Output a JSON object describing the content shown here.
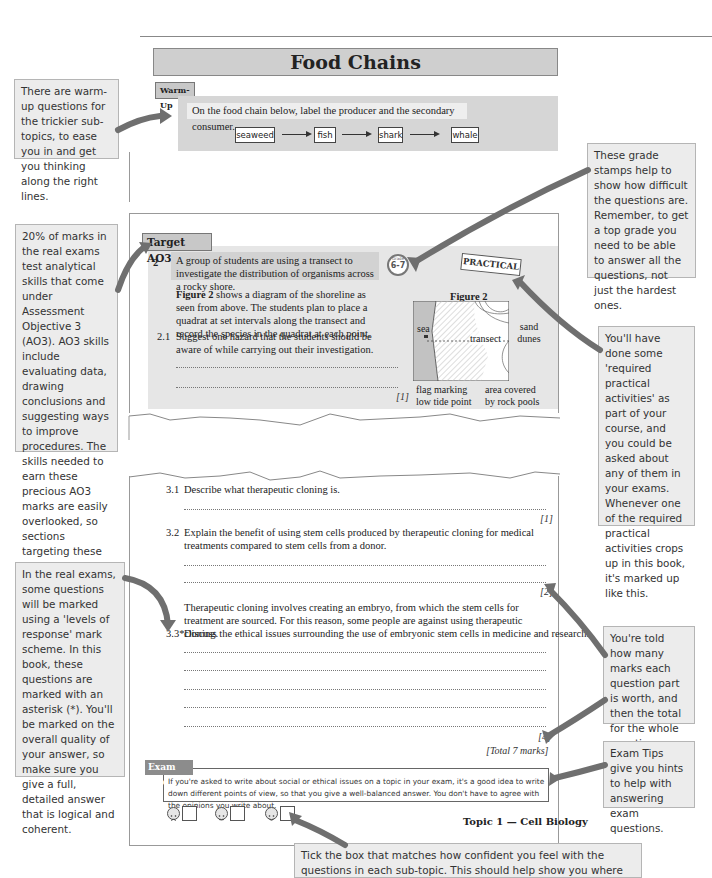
{
  "callouts": {
    "warmup": "There are warm-up questions for the trickier sub-topics, to ease you in and get you thinking along the right lines.",
    "grade": "These grade stamps help to show how difficult the questions are. Remember, to get a top grade you need to be able to answer all the questions, not just the hardest ones.",
    "ao3": "20% of marks in the real exams test analytical skills that come under Assessment Objective 3 (AO3). AO3 skills include evaluating data, drawing conclusions and suggesting ways to improve procedures. The skills needed to earn these precious AO3 marks are easily overlooked, so sections targeting these skills are marked up like this.",
    "practical": "You'll have done some 'required practical activities' as part of your course, and you could be asked about any of them in your exams. Whenever one of the required practical activities crops up in this book, it's marked up like this.",
    "levels": "In the real exams, some questions will be marked using a 'levels of response' mark scheme. In this book, these questions are marked with an asterisk (*). You'll be marked on the overall quality of your answer, so make sure you give a full, detailed answer that is logical and coherent.",
    "marks": "You're told how many marks each question part is worth, and then the total for the whole question.",
    "examtips": "Exam Tips give you hints to help with answering exam questions.",
    "tickbox": "Tick the box that matches how confident you feel with the questions in each sub-topic. This should help show you where you need to focus your revision."
  },
  "page1": {
    "title": "Food Chains",
    "warmup_label": "Warm-Up",
    "warmup_question": "On the food chain below, label the producer and the secondary consumer.",
    "chain": [
      "seaweed",
      "fish",
      "shark",
      "whale"
    ]
  },
  "page2": {
    "tag": "Target AO3",
    "q_number": "2",
    "q_intro": "A group of students are using a transect to investigate the distribution of organisms across a rocky shore.",
    "grade_stamp_label": "Grade",
    "grade_stamp": "6-7",
    "practical_stamp": "PRACTICAL",
    "figure_ref": "Figure 2",
    "figure_text": " shows a diagram of the shoreline as seen from above. The students plan to place a quadrat at set intervals along the transect and record the species in the quadrat at each point.",
    "q21_number": "2.1",
    "q21_text": "Suggest one hazard that the students should be aware of while carrying out their investigation.",
    "q21_mark": "[1]",
    "figure": {
      "title": "Figure 2",
      "labels": {
        "sea": "sea",
        "transect": "transect",
        "sand_dunes": "sand dunes",
        "flag": "flag marking low tide point",
        "rock_pools": "area covered by rock pools"
      }
    }
  },
  "page3": {
    "q31_number": "3.1",
    "q31_text": "Describe what therapeutic cloning is.",
    "q31_mark": "[1]",
    "q32_number": "3.2",
    "q32_text": "Explain the benefit of using stem cells produced by therapeutic cloning for medical treatments compared to stem cells from a donor.",
    "q32_mark": "[2]",
    "context": "Therapeutic cloning involves creating an embryo, from which the stem cells for treatment are sourced.  For this reason, some people are against using therapeutic cloning.",
    "q33_number": "3.3*",
    "q33_text": "Discuss the ethical issues surrounding the use of embryonic stem cells in medicine and research.",
    "q33_mark": "[4]",
    "total": "[Total 7 marks]",
    "exam_tip_label": "Exam Tip",
    "exam_tip_text": "If you're asked to write about social or ethical issues on a topic in your exam, it's a good idea to write down different points of view, so that you give a well-balanced answer.  You don't have to agree with the opinions you write about.",
    "footer": "Topic 1 — Cell Biology",
    "confidence": [
      "not-confident",
      "neutral",
      "confident"
    ]
  },
  "colors": {
    "callout_bg": "#ececec",
    "header_grey": "#cfcfcf",
    "arrow_grey": "#6f6f6f",
    "exam_tip_tag": "#8c8c8c"
  }
}
